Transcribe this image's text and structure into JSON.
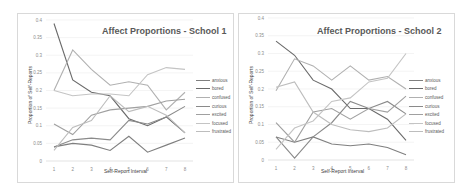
{
  "chart_data": [
    {
      "type": "line",
      "title": "Affect Proportions - School 1",
      "xlabel": "Self-Report Interval",
      "ylabel": "Proportion of Self-Reports",
      "x": [
        1,
        2,
        3,
        4,
        5,
        6,
        7,
        8
      ],
      "ylim": [
        0,
        0.4
      ],
      "yticks": [
        "0",
        "0.05",
        "0.1",
        "0.15",
        "0.2",
        "0.25",
        "0.3",
        "0.35",
        "0.4"
      ],
      "grid": true,
      "legend_position": "right",
      "series": [
        {
          "name": "anxious",
          "color": "#7f7f7f",
          "values": [
            0.04,
            0.05,
            0.045,
            0.03,
            0.07,
            0.025,
            0.045,
            0.065
          ]
        },
        {
          "name": "bored",
          "color": "#6a6a6a",
          "values": [
            0.39,
            0.23,
            0.195,
            0.185,
            0.12,
            0.1,
            0.125,
            0.08
          ]
        },
        {
          "name": "confused",
          "color": "#b0b0b0",
          "values": [
            0.2,
            0.315,
            0.26,
            0.215,
            0.225,
            0.215,
            0.145,
            0.195
          ]
        },
        {
          "name": "curious",
          "color": "#8a8a8a",
          "values": [
            0.04,
            0.06,
            0.065,
            0.06,
            0.115,
            0.105,
            0.125,
            0.155
          ]
        },
        {
          "name": "excited",
          "color": "#a0a0a0",
          "values": [
            0.105,
            0.075,
            0.13,
            0.145,
            0.15,
            0.155,
            0.17,
            0.175
          ]
        },
        {
          "name": "focused",
          "color": "#c4c4c4",
          "values": [
            0.2,
            0.185,
            0.19,
            0.19,
            0.185,
            0.245,
            0.265,
            0.26
          ]
        },
        {
          "name": "frustrated",
          "color": "#bdbdbd",
          "values": [
            0.03,
            0.095,
            0.115,
            0.185,
            0.14,
            0.155,
            0.13,
            0.08
          ]
        }
      ]
    },
    {
      "type": "line",
      "title": "Affect Proportions - School 2",
      "xlabel": "Self-Report Interval",
      "ylabel": "Proportion of Self-Reports",
      "x": [
        1,
        2,
        3,
        4,
        5,
        6,
        7,
        8
      ],
      "ylim": [
        0,
        0.4
      ],
      "yticks": [
        "0",
        "0.05",
        "0.1",
        "0.15",
        "0.2",
        "0.25",
        "0.3",
        "0.35",
        "0.4"
      ],
      "grid": true,
      "legend_position": "right",
      "series": [
        {
          "name": "anxious",
          "color": "#7f7f7f",
          "values": [
            0.065,
            0.05,
            0.065,
            0.045,
            0.04,
            0.045,
            0.035,
            0.015
          ]
        },
        {
          "name": "bored",
          "color": "#6a6a6a",
          "values": [
            0.335,
            0.295,
            0.225,
            0.2,
            0.145,
            0.145,
            0.115,
            0.055
          ]
        },
        {
          "name": "confused",
          "color": "#b0b0b0",
          "values": [
            0.195,
            0.285,
            0.265,
            0.225,
            0.265,
            0.225,
            0.235,
            0.2
          ]
        },
        {
          "name": "curious",
          "color": "#8a8a8a",
          "values": [
            0.065,
            0.005,
            0.065,
            0.105,
            0.165,
            0.145,
            0.165,
            0.13
          ]
        },
        {
          "name": "excited",
          "color": "#a0a0a0",
          "values": [
            0.105,
            0.05,
            0.135,
            0.145,
            0.115,
            0.145,
            0.135,
            0.18
          ]
        },
        {
          "name": "focused",
          "color": "#c4c4c4",
          "values": [
            0.03,
            0.09,
            0.11,
            0.165,
            0.175,
            0.22,
            0.23,
            0.3
          ]
        },
        {
          "name": "frustrated",
          "color": "#bdbdbd",
          "values": [
            0.205,
            0.22,
            0.135,
            0.1,
            0.085,
            0.08,
            0.09,
            0.13
          ]
        }
      ]
    }
  ],
  "charts": [
    {
      "title": "Affect Proportions - School 1",
      "xlabel": "Self-Report Interval",
      "ylabel": "Proportion of Self-Reports",
      "legend": [
        "anxious",
        "bored",
        "confused",
        "curious",
        "excited",
        "focused",
        "frustrated"
      ]
    },
    {
      "title": "Affect Proportions - School 2",
      "xlabel": "Self-Report Interval",
      "ylabel": "Proportion of Self-Reports",
      "legend": [
        "anxious",
        "bored",
        "confused",
        "curious",
        "excited",
        "focused",
        "frustrated"
      ]
    }
  ]
}
